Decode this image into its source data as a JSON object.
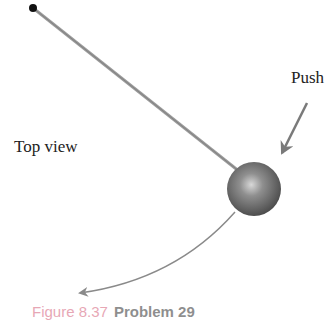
{
  "diagram": {
    "labels": {
      "top_view": "Top view",
      "push": "Push"
    },
    "caption": {
      "figure": "Figure 8.37",
      "problem": "Problem 29"
    },
    "elements": {
      "pivot": {
        "x": 33,
        "y": 8,
        "r": 4,
        "color": "#111111"
      },
      "rod": {
        "x1": 33,
        "y1": 8,
        "x2": 240,
        "y2": 172,
        "color": "#8a8a8a"
      },
      "ball": {
        "cx": 254,
        "cy": 189,
        "r": 27,
        "color": "#6b6b6b"
      },
      "push_arrow": {
        "x1": 307,
        "y1": 103,
        "x2": 281,
        "y2": 155,
        "color": "#808080"
      },
      "path_arrow": {
        "from": [
          235,
          212
        ],
        "to": [
          78,
          293
        ],
        "color": "#808080"
      }
    }
  }
}
